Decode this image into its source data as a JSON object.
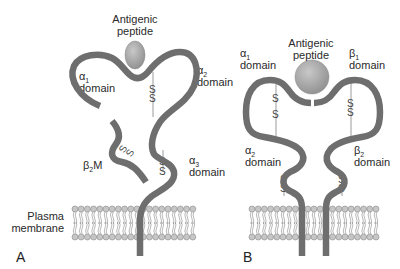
{
  "figure": {
    "panels": [
      {
        "id": "A",
        "panel_label": "A",
        "title": "MHC class I molecule",
        "labels": {
          "peptide_line1": "Antigenic",
          "peptide_line2": "peptide",
          "alpha1_symbol": "α",
          "alpha1_sub": "1",
          "alpha1_word": "domain",
          "alpha2_symbol": "α",
          "alpha2_sub": "2",
          "alpha2_word": "domain",
          "alpha3_symbol": "α",
          "alpha3_sub": "3",
          "alpha3_word": "domain",
          "b2m_symbol": "β",
          "b2m_sub": "2",
          "b2m_suffix": "M",
          "membrane_line1": "Plasma",
          "membrane_line2": "membrane"
        },
        "disulfide_letter": "S"
      },
      {
        "id": "B",
        "panel_label": "B",
        "title": "MHC class II molecule",
        "labels": {
          "peptide_line1": "Antigenic",
          "peptide_line2": "peptide",
          "alpha1_symbol": "α",
          "alpha1_sub": "1",
          "alpha1_word": "domain",
          "beta1_symbol": "β",
          "beta1_sub": "1",
          "beta1_word": "domain",
          "alpha2_symbol": "α",
          "alpha2_sub": "2",
          "alpha2_word": "domain",
          "beta2_symbol": "β",
          "beta2_sub": "2",
          "beta2_word": "domain"
        },
        "disulfide_letter": "S"
      }
    ],
    "colors": {
      "chain": "#6e6e6e",
      "peptide": "#a9a9a9",
      "membrane_head": "#bdbdbd",
      "membrane_tail": "#8c8c8c",
      "text": "#2a2a2a"
    }
  }
}
